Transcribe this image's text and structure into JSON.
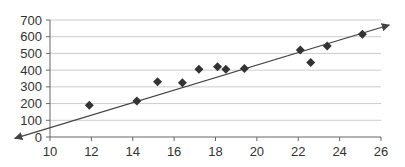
{
  "chart_data": {
    "type": "scatter",
    "title": "",
    "xlabel": "",
    "ylabel": "",
    "xlim": [
      10,
      26
    ],
    "ylim": [
      0,
      700
    ],
    "x_ticks": [
      10,
      12,
      14,
      16,
      18,
      20,
      22,
      24,
      26
    ],
    "y_ticks": [
      0,
      100,
      200,
      300,
      400,
      500,
      600,
      700
    ],
    "grid": {
      "horizontal": true,
      "vertical": false
    },
    "legend": null,
    "series": [
      {
        "name": "data",
        "marker": "diamond",
        "color": "#333333",
        "points": [
          {
            "x": 11.9,
            "y": 190
          },
          {
            "x": 14.2,
            "y": 215
          },
          {
            "x": 15.2,
            "y": 330
          },
          {
            "x": 16.4,
            "y": 325
          },
          {
            "x": 17.2,
            "y": 405
          },
          {
            "x": 18.1,
            "y": 420
          },
          {
            "x": 18.5,
            "y": 405
          },
          {
            "x": 19.4,
            "y": 410
          },
          {
            "x": 22.1,
            "y": 520
          },
          {
            "x": 22.6,
            "y": 445
          },
          {
            "x": 23.4,
            "y": 545
          },
          {
            "x": 25.1,
            "y": 615
          }
        ]
      }
    ],
    "trend_line": {
      "type": "linear",
      "arrows": "both",
      "color": "#444444",
      "start": {
        "x": 8.3,
        "y": -8
      },
      "end": {
        "x": 26.4,
        "y": 670
      }
    }
  },
  "colors": {
    "axis": "#666666",
    "grid": "#cccccc",
    "marker": "#333333",
    "line": "#444444",
    "text": "#333333"
  }
}
